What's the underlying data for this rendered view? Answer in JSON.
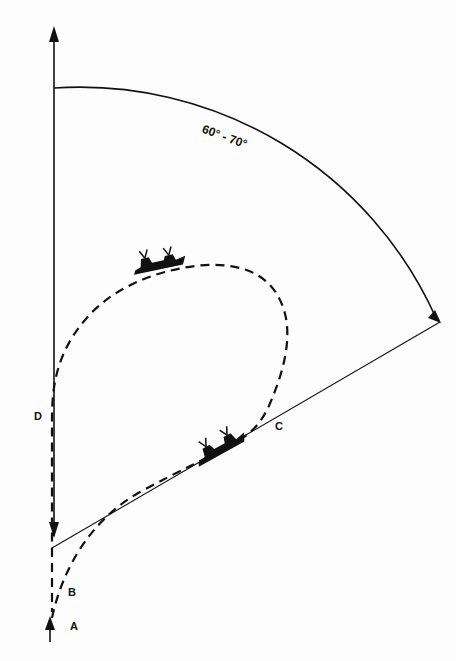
{
  "diagram": {
    "angle_label": "60° - 70°",
    "points": [
      {
        "id": "A",
        "label": "A"
      },
      {
        "id": "B",
        "label": "B"
      },
      {
        "id": "C",
        "label": "C"
      },
      {
        "id": "D",
        "label": "D"
      }
    ],
    "colors": {
      "ink": "#111111",
      "paper": "#fdfdfd"
    },
    "icons": [
      "ship-icon",
      "ship-icon",
      "arrow-up-icon",
      "arrow-down-icon"
    ]
  }
}
